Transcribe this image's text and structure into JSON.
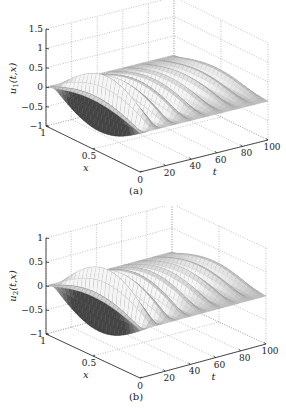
{
  "chart_data": [
    {
      "type": "surface3d",
      "panel_label": "(a)",
      "zlabel": "u_1(t,x)",
      "zlabel_main": "u",
      "zlabel_sub": "1",
      "zlabel_args": "(t,x)",
      "xlabel": "x",
      "tlabel": "t",
      "zticks": [
        "1.5",
        "1",
        "0.5",
        "0",
        "-0.5",
        "-1"
      ],
      "zvals": [
        1.5,
        1,
        0.5,
        0,
        -0.5,
        -1
      ],
      "zlim": [
        -1,
        1.5
      ],
      "xticks": [
        "1",
        "0.5",
        "0"
      ],
      "xlim": [
        0,
        1
      ],
      "tticks": [
        "0",
        "20",
        "40",
        "60",
        "80",
        "100"
      ],
      "tlim": [
        0,
        100
      ],
      "grid": true,
      "surface": {
        "initial_amplitude": 0.9,
        "decay_rate": 0.04,
        "oscillation_period": 12,
        "shading": "gray"
      }
    },
    {
      "type": "surface3d",
      "panel_label": "(b)",
      "zlabel": "u_2(t,x)",
      "zlabel_main": "u",
      "zlabel_sub": "2",
      "zlabel_args": "(t,x)",
      "xlabel": "x",
      "tlabel": "t",
      "zticks": [
        "1",
        "0.5",
        "0",
        "-0.5",
        "-1"
      ],
      "zvals": [
        1,
        0.5,
        0,
        -0.5,
        -1
      ],
      "zlim": [
        -1,
        1
      ],
      "xticks": [
        "1",
        "0.5",
        "0"
      ],
      "xlim": [
        0,
        1
      ],
      "tticks": [
        "0",
        "20",
        "40",
        "60",
        "80",
        "100"
      ],
      "tlim": [
        0,
        100
      ],
      "grid": true,
      "surface": {
        "initial_amplitude": 0.8,
        "decay_rate": 0.035,
        "oscillation_period": 12,
        "shading": "gray"
      }
    }
  ]
}
